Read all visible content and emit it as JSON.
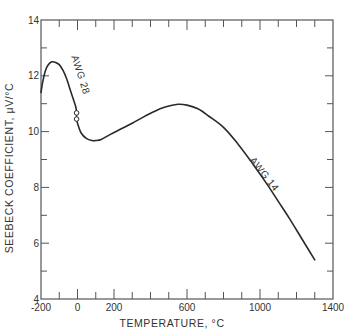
{
  "chart_data": {
    "type": "line",
    "title": "",
    "xlabel": "TEMPERATURE, °C",
    "ylabel": "SEEBECK COEFFICIENT, μV/°C",
    "xlim": [
      -200,
      1400
    ],
    "ylim": [
      4,
      14
    ],
    "x_ticks": [
      -200,
      0,
      200,
      600,
      1000,
      1400
    ],
    "x_tick_labels": [
      "-200",
      "0",
      "200",
      "600",
      "1000",
      "1400"
    ],
    "x_minor_ticks": [
      -100,
      100,
      300,
      400,
      500,
      700,
      800,
      900,
      1100,
      1200,
      1300
    ],
    "y_ticks": [
      4,
      6,
      8,
      10,
      12,
      14
    ],
    "y_tick_labels": [
      "4",
      "6",
      "8",
      "10",
      "12",
      "14"
    ],
    "y_minor_ticks": [
      5,
      7,
      9,
      11,
      13
    ],
    "grid": false,
    "legend": "none",
    "series": [
      {
        "name": "AWG 28",
        "x": [
          -200,
          -190,
          -175,
          -160,
          -140,
          -120,
          -100,
          -80,
          -60,
          -40,
          -25,
          -10,
          -5
        ],
        "values": [
          11.4,
          11.8,
          12.2,
          12.4,
          12.5,
          12.48,
          12.4,
          12.2,
          11.9,
          11.5,
          11.2,
          10.9,
          10.7
        ]
      },
      {
        "name": "AWG 14",
        "x": [
          -5,
          0,
          20,
          50,
          80,
          100,
          130,
          180,
          240,
          300,
          360,
          420,
          480,
          550,
          600,
          660,
          720,
          800,
          880,
          960,
          1040,
          1100,
          1160,
          1230,
          1300
        ],
        "values": [
          10.45,
          10.3,
          9.95,
          9.75,
          9.68,
          9.68,
          9.72,
          9.9,
          10.1,
          10.3,
          10.52,
          10.72,
          10.88,
          10.98,
          10.95,
          10.82,
          10.55,
          10.15,
          9.55,
          8.85,
          8.1,
          7.5,
          6.9,
          6.15,
          5.4
        ]
      }
    ],
    "markers": [
      {
        "x": -5,
        "y": 10.67,
        "shape": "open-circle"
      },
      {
        "x": -5,
        "y": 10.45,
        "shape": "open-circle"
      }
    ],
    "annotations": [
      {
        "text": "AWG 28",
        "x": 0,
        "y": 12.0,
        "rotation": 72
      },
      {
        "text": "AWG 14",
        "x": 1010,
        "y": 8.4,
        "rotation": 52
      }
    ]
  },
  "colors": {
    "line": "#2a2a2a",
    "axis": "#555555",
    "text": "#333333",
    "background": "#ffffff"
  }
}
